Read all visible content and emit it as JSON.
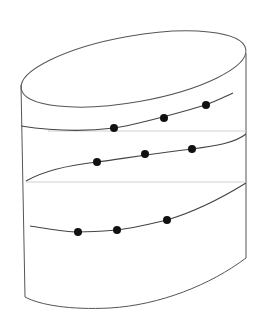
{
  "diagram": {
    "colors": {
      "background": "#ffffff",
      "outline": "#555555",
      "guide_line": "#d0d0d0",
      "curve": "#444444",
      "dot": "#111111"
    },
    "shape": {
      "top_ellipse": {
        "cx": 133.5,
        "cy": 69,
        "rx": 114,
        "ry": 33,
        "rotate": -10
      },
      "left_edge": {
        "x1": 21,
        "y1": 85,
        "x2": 25,
        "y2": 297
      },
      "right_edge": {
        "x1": 246,
        "y1": 53,
        "x2": 246,
        "y2": 258
      },
      "bottom_curve": "M25,297 C40,305 70,310 110,308 C160,305 210,285 246,258"
    },
    "guide_lines": [
      {
        "x1": 48,
        "y1": 131,
        "x2": 246,
        "y2": 131
      },
      {
        "x1": 26,
        "y1": 182,
        "x2": 246,
        "y2": 182
      }
    ],
    "curves": [
      {
        "path": "M21,126 C60,132 90,131 114,128 C140,124 170,115 206,105 C215,101 225,97 233,93",
        "dots": [
          {
            "x": 114,
            "y": 128
          },
          {
            "x": 164,
            "y": 118
          },
          {
            "x": 206,
            "y": 105
          }
        ]
      },
      {
        "path": "M26,181 C45,170 70,165 97,162 C120,159 150,154 192,149 C215,146 235,143 246,134",
        "dots": [
          {
            "x": 97,
            "y": 162
          },
          {
            "x": 145,
            "y": 154
          },
          {
            "x": 192,
            "y": 149
          }
        ]
      },
      {
        "path": "M30,226 C50,229 65,232 78,232 C95,232 105,231 117,230 C135,228 150,224 167,220 C200,210 225,196 246,183",
        "dots": [
          {
            "x": 78,
            "y": 232
          },
          {
            "x": 117,
            "y": 230
          },
          {
            "x": 167,
            "y": 220
          }
        ]
      }
    ],
    "dot_radius": 4
  }
}
